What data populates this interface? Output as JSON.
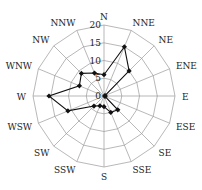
{
  "chart_data": {
    "type": "radar",
    "title": "",
    "categories": [
      "N",
      "NNE",
      "NE",
      "ENE",
      "E",
      "ESE",
      "SE",
      "SSE",
      "S",
      "SSW",
      "SW",
      "WSW",
      "W",
      "WNW",
      "NW",
      "NNW"
    ],
    "series": [
      {
        "name": "frequency",
        "values": [
          6,
          15,
          10,
          0.3,
          0.3,
          0.3,
          5.5,
          5,
          3,
          3,
          4,
          11,
          15.5,
          7.5,
          9,
          7
        ],
        "color": "#111111",
        "marker": "diamond"
      }
    ],
    "radial_ticks": [
      "0",
      "5",
      "10",
      "15",
      "20"
    ],
    "radial_tick_values": [
      0,
      5,
      10,
      15,
      20
    ],
    "rlim": [
      0,
      20
    ],
    "grid": true,
    "legend": false,
    "grid_shape": "polygon"
  }
}
